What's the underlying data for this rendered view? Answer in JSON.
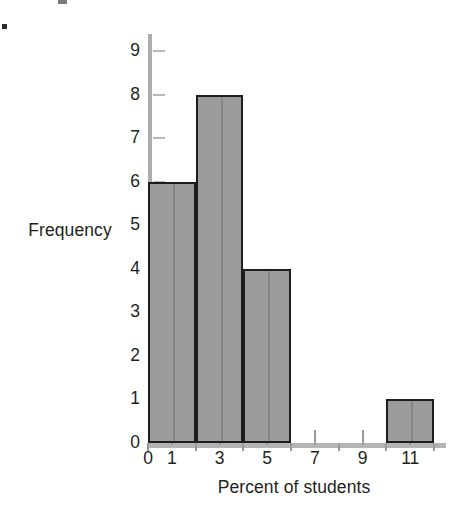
{
  "chart_data": {
    "type": "bar",
    "title": "",
    "subtitle": "",
    "xlabel": "Percent of students",
    "ylabel": "Frequency",
    "grid": false,
    "legend": null,
    "xlim": [
      0,
      12.5
    ],
    "ylim": [
      0,
      9.4
    ],
    "x_tick_labels": [
      "0",
      "1",
      "3",
      "5",
      "7",
      "9",
      "11"
    ],
    "x_tick_values": [
      0,
      1,
      3,
      5,
      7,
      9,
      11
    ],
    "y_tick_labels": [
      "0",
      "1",
      "2",
      "3",
      "4",
      "5",
      "6",
      "7",
      "8",
      "9"
    ],
    "y_tick_values": [
      0,
      1,
      2,
      3,
      4,
      5,
      6,
      7,
      8,
      9
    ],
    "bin_width": 2,
    "bins": [
      {
        "label": "0-2",
        "start": 0,
        "end": 2,
        "value": 6
      },
      {
        "label": "2-4",
        "start": 2,
        "end": 4,
        "value": 8
      },
      {
        "label": "4-6",
        "start": 4,
        "end": 6,
        "value": 4
      },
      {
        "label": "6-8",
        "start": 6,
        "end": 8,
        "value": 0
      },
      {
        "label": "8-10",
        "start": 8,
        "end": 10,
        "value": 0
      },
      {
        "label": "10-12",
        "start": 10,
        "end": 12,
        "value": 1
      }
    ],
    "categories": [
      "0-2",
      "2-4",
      "4-6",
      "6-8",
      "8-10",
      "10-12"
    ],
    "values": [
      6,
      8,
      4,
      0,
      0,
      1
    ],
    "colors": {
      "bar_fill": "#9c9c9c",
      "bar_edge": "#1d1d1d",
      "axis": "#b4b4b4",
      "text": "#231f20",
      "background": "#ffffff"
    }
  }
}
